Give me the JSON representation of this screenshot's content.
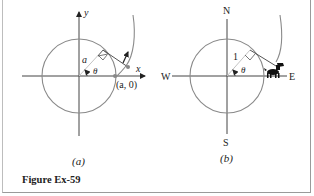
{
  "figure": {
    "caption": "Figure Ex-59",
    "panels": [
      {
        "id": "a",
        "label": "(a)",
        "axes": {
          "x_label": "x",
          "y_label": "y"
        },
        "radius_label": "a",
        "angle_label": "θ",
        "point_label": "(a, 0)"
      },
      {
        "id": "b",
        "label": "(b)",
        "compass": {
          "north": "N",
          "south": "S",
          "east": "E",
          "west": "W"
        },
        "radius_label": "1",
        "angle_label": "θ"
      }
    ]
  },
  "colors": {
    "circle": "#8a8a8a",
    "axis": "#444444",
    "tangent": "#555555",
    "radius": "#c4c4c4",
    "text": "#222222"
  }
}
